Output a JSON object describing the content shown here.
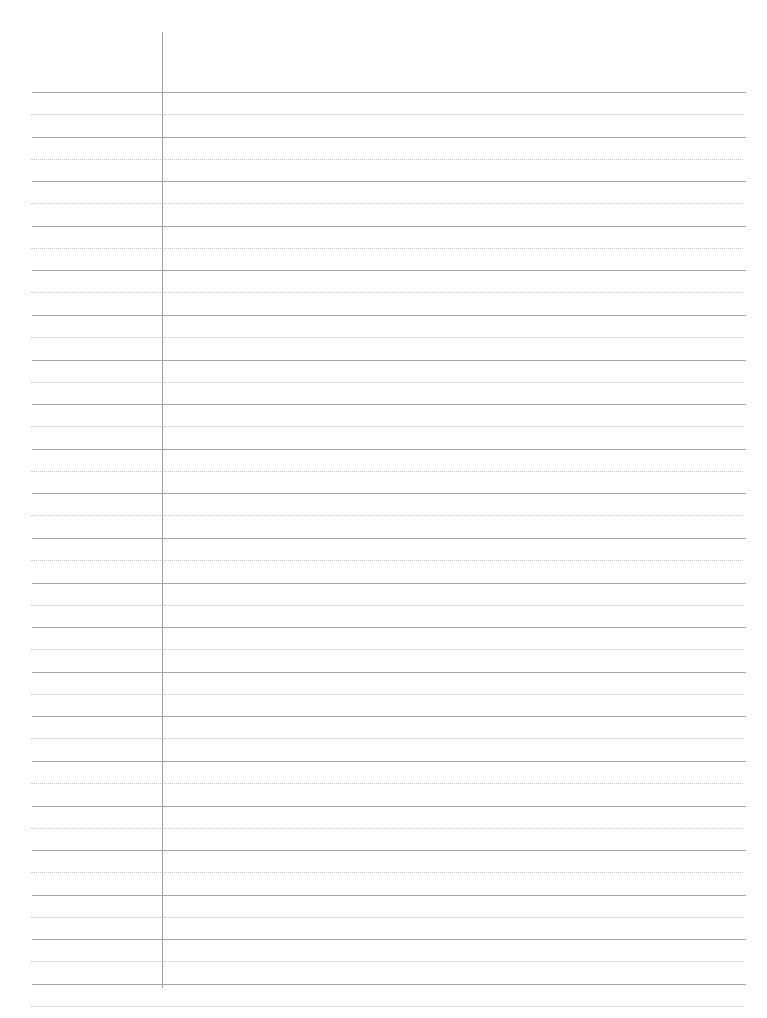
{
  "document": {
    "type": "lined-notebook-paper",
    "title": "Blank Ruled Notebook Page",
    "content_text": "",
    "is_blank": true,
    "page_width": 767,
    "page_height": 1018,
    "background_color": "#ffffff"
  },
  "ruling": {
    "solid_line_color": "#a0a2a6",
    "dotted_line_color": "#c2c4c8",
    "margin_line_color": "#9a9c9f",
    "solid_line_count": 21,
    "dotted_line_count": 21,
    "line_spacing_px": 44.6,
    "first_solid_line_y": 92,
    "last_solid_line_y": 963,
    "dotted_offset_px": 22,
    "rule_left_x": 32,
    "rule_right_x": 746,
    "dotted_left_x": 31,
    "dotted_right_x": 743
  },
  "margin": {
    "vertical_line_x": 162,
    "vertical_line_top_y": 32,
    "vertical_line_bottom_y": 988
  },
  "labels": {
    "page_region": "notebook-page",
    "margin_region": "left-margin",
    "writing_region": "writing-area"
  }
}
